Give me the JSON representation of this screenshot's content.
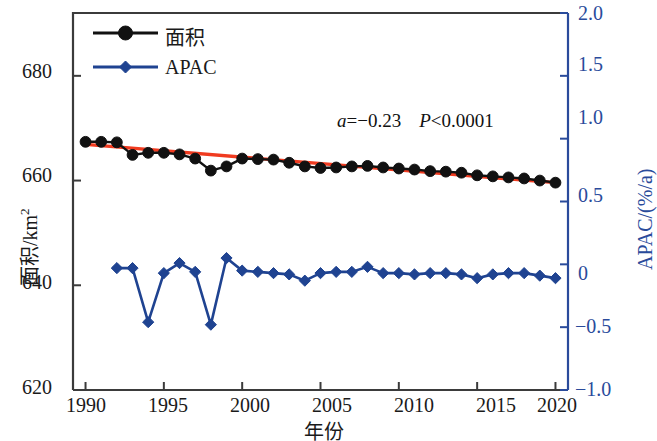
{
  "chart_data": {
    "type": "line",
    "title": "",
    "xlabel": "年份",
    "ylabel": "面积/km²",
    "y2label": "APAC/((%/a)",
    "y2label_text": "APAC/(%/a)",
    "xlim": [
      1989.2,
      2020.8
    ],
    "ylim": [
      620,
      692
    ],
    "y2lim": [
      -1.0,
      2.0
    ],
    "grid": false,
    "legend_position": "top-left",
    "x_ticks": [
      1990,
      1995,
      2000,
      2005,
      2010,
      2015,
      2020
    ],
    "x_tick_labels": [
      "1990",
      "1995",
      "2000",
      "2005",
      "2010",
      "2015",
      "2020"
    ],
    "y_ticks": [
      620,
      640,
      660,
      680
    ],
    "y_tick_labels": [
      "620",
      "640",
      "660",
      "680"
    ],
    "y2_ticks": [
      -1.0,
      -0.5,
      0,
      0.5,
      1.0,
      1.5,
      2.0
    ],
    "y2_tick_labels": [
      "-1.0",
      "-0.5",
      "0",
      "0.5",
      "1.0",
      "1.5",
      "2.0"
    ],
    "x": [
      1990,
      1991,
      1992,
      1993,
      1994,
      1995,
      1996,
      1997,
      1998,
      1999,
      2000,
      2001,
      2002,
      2003,
      2004,
      2005,
      2006,
      2007,
      2008,
      2009,
      2010,
      2011,
      2012,
      2013,
      2014,
      2015,
      2016,
      2017,
      2018,
      2019,
      2020
    ],
    "series": [
      {
        "name": "面积",
        "axis": "left",
        "color": "#111111",
        "marker": "circle",
        "values": [
          667.4,
          667.4,
          667.3,
          664.9,
          665.3,
          665.3,
          665.0,
          664.2,
          661.9,
          662.7,
          664.2,
          664.1,
          664.0,
          663.4,
          662.7,
          662.4,
          662.5,
          662.7,
          662.8,
          662.5,
          662.3,
          662.1,
          661.8,
          661.7,
          661.5,
          661.0,
          660.8,
          660.6,
          660.4,
          660.0,
          659.6
        ]
      },
      {
        "name": "APAC",
        "axis": "right",
        "color": "#1f4391",
        "marker": "diamond",
        "values": [
          null,
          null,
          -0.03,
          -0.03,
          -0.46,
          -0.07,
          0.01,
          -0.06,
          -0.48,
          0.05,
          -0.05,
          -0.06,
          -0.07,
          -0.08,
          -0.13,
          -0.07,
          -0.06,
          -0.06,
          -0.02,
          -0.07,
          -0.07,
          -0.08,
          -0.07,
          -0.07,
          -0.08,
          -0.11,
          -0.08,
          -0.07,
          -0.07,
          -0.09,
          -0.11
        ]
      }
    ],
    "trend_line": {
      "name": "linear-trend",
      "color": "#f03b20",
      "x": [
        1990,
        2020
      ],
      "y": [
        666.9,
        659.6
      ],
      "slope": -0.23
    },
    "annotation": {
      "slope_symbol": "a",
      "slope_text": "=−0.23",
      "p_symbol": "P",
      "p_text": "<0.0001",
      "full": "a=−0.23   P<0.0001"
    }
  },
  "legend": {
    "items": [
      {
        "label": "面积",
        "color": "#111111",
        "marker": "circle"
      },
      {
        "label": "APAC",
        "color": "#1f4391",
        "marker": "diamond"
      }
    ]
  },
  "axes": {
    "left": {
      "title_main": "面积/km",
      "title_sup": "2",
      "labels": [
        "680",
        "660",
        "640",
        "620"
      ]
    },
    "right": {
      "title": "APAC/(%/a)",
      "labels": [
        "2.0",
        "1.5",
        "1.0",
        "0.5",
        "0",
        "−0.5",
        "−1.0"
      ],
      "color": "#2a4b9b"
    },
    "bottom": {
      "title": "年份",
      "labels": [
        "1990",
        "1995",
        "2000",
        "2005",
        "2010",
        "2015",
        "2020"
      ]
    }
  },
  "colors": {
    "area_series": "#111111",
    "apac_series": "#1f4391",
    "trend": "#f03b20",
    "right_axis": "#2a4b9b",
    "frame": "#3b3b3b"
  }
}
